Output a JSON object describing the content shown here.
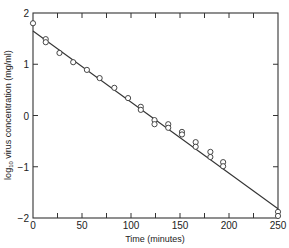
{
  "chart_data": {
    "type": "scatter",
    "title": "",
    "xlabel": "Time (minutes)",
    "ylabel": "log10 virus concentration (mg/ml)",
    "ylabel_parts": {
      "prefix": "log",
      "subscript": "10",
      "suffix": " virus concentration (mg/ml)"
    },
    "xlim": [
      0,
      250
    ],
    "ylim": [
      -2,
      2
    ],
    "x_ticks": [
      0,
      50,
      100,
      150,
      200,
      250
    ],
    "x_tick_labels": [
      "0",
      "50",
      "100",
      "150",
      "200",
      "250"
    ],
    "x_minor_ticks": [
      25,
      75,
      125,
      175,
      225
    ],
    "y_ticks": [
      -2,
      -1,
      0,
      1,
      2
    ],
    "y_tick_labels": [
      "−2",
      "−1",
      "0",
      "1",
      "2"
    ],
    "grid": false,
    "legend": null,
    "series": [
      {
        "name": "observed",
        "marker": "open-circle",
        "points": [
          [
            0,
            1.8
          ],
          [
            13,
            1.49
          ],
          [
            13,
            1.43
          ],
          [
            27,
            1.22
          ],
          [
            41,
            1.04
          ],
          [
            55,
            0.89
          ],
          [
            68,
            0.73
          ],
          [
            83,
            0.54
          ],
          [
            97,
            0.34
          ],
          [
            110,
            0.17
          ],
          [
            110,
            0.11
          ],
          [
            124,
            -0.09
          ],
          [
            124,
            -0.17
          ],
          [
            138,
            -0.17
          ],
          [
            138,
            -0.24
          ],
          [
            152,
            -0.32
          ],
          [
            152,
            -0.37
          ],
          [
            166,
            -0.52
          ],
          [
            166,
            -0.61
          ],
          [
            181,
            -0.71
          ],
          [
            181,
            -0.81
          ],
          [
            194,
            -0.91
          ],
          [
            194,
            -0.99
          ],
          [
            250,
            -1.88
          ],
          [
            250,
            -1.96
          ]
        ]
      },
      {
        "name": "fit",
        "type": "line",
        "points": [
          [
            0,
            1.65
          ],
          [
            250,
            -1.82
          ]
        ]
      }
    ]
  }
}
